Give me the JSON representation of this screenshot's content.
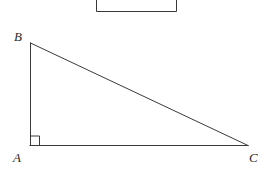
{
  "figure": {
    "canvas": {
      "width": 272,
      "height": 175,
      "background": "#ffffff"
    },
    "stroke_color": "#3a3a3a",
    "stroke_width": 1,
    "labels": {
      "B": "B",
      "A": "A",
      "C": "C"
    },
    "vertices": {
      "B": {
        "x": 30,
        "y": 43
      },
      "A": {
        "x": 30,
        "y": 145
      },
      "C": {
        "x": 248,
        "y": 146
      }
    },
    "right_angle_marker": {
      "at_vertex": "A",
      "size": 9,
      "x": 30,
      "y": 136
    },
    "partial_rectangle": {
      "description": "rectangle cropped by the top edge of the image",
      "left": 96,
      "right": 177,
      "top": -6,
      "bottom": 12
    },
    "segments": [
      {
        "name": "AB",
        "from": "A",
        "to": "B"
      },
      {
        "name": "BC",
        "from": "B",
        "to": "C"
      },
      {
        "name": "AC",
        "from": "A",
        "to": "C"
      }
    ]
  }
}
